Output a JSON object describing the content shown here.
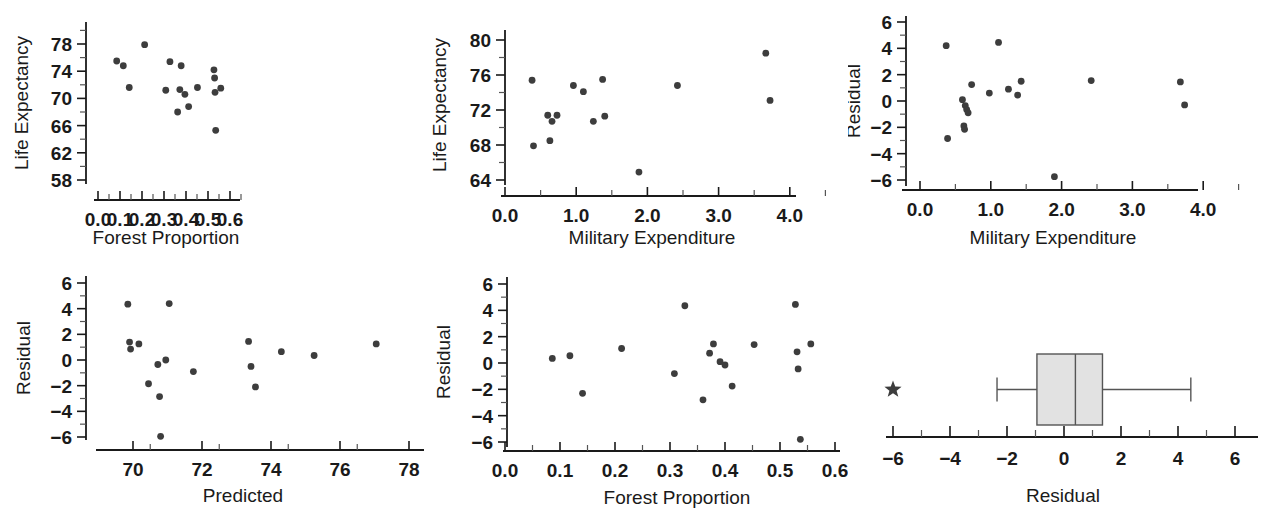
{
  "figure": {
    "layout": "2 rows x 3 columns of statistical panels",
    "background": "#ffffff",
    "point_color": "#3d3d3d",
    "axis_color": "#1a1a1a",
    "box_fill": "#e2e2e2"
  },
  "chart_data": [
    {
      "id": "panel-life-vs-forest",
      "type": "scatter",
      "title": "",
      "xlabel": "Forest Proportion",
      "ylabel": "Life Expectancy",
      "xlim": [
        0.0,
        0.62
      ],
      "ylim": [
        57.0,
        79.5
      ],
      "xticks": [
        "0.0",
        "0.1",
        "0.2",
        "0.3",
        "0.4",
        "0.5",
        "0.6"
      ],
      "xtick_values": [
        0.0,
        0.1,
        0.2,
        0.3,
        0.4,
        0.5,
        0.6
      ],
      "yticks": [
        "78",
        "74",
        "70",
        "66",
        "62",
        "58"
      ],
      "ytick_values": [
        78,
        74,
        70,
        66,
        62,
        58
      ],
      "grid": false,
      "legend": "none",
      "points": [
        {
          "x": 0.085,
          "y": 75.5
        },
        {
          "x": 0.115,
          "y": 74.8
        },
        {
          "x": 0.142,
          "y": 71.6
        },
        {
          "x": 0.212,
          "y": 77.9
        },
        {
          "x": 0.308,
          "y": 71.2
        },
        {
          "x": 0.327,
          "y": 75.4
        },
        {
          "x": 0.362,
          "y": 68.0
        },
        {
          "x": 0.372,
          "y": 71.3
        },
        {
          "x": 0.378,
          "y": 74.8
        },
        {
          "x": 0.395,
          "y": 70.6
        },
        {
          "x": 0.412,
          "y": 68.8
        },
        {
          "x": 0.452,
          "y": 71.6
        },
        {
          "x": 0.527,
          "y": 74.2
        },
        {
          "x": 0.53,
          "y": 73.0
        },
        {
          "x": 0.532,
          "y": 70.9
        },
        {
          "x": 0.535,
          "y": 65.3
        },
        {
          "x": 0.558,
          "y": 71.5
        }
      ]
    },
    {
      "id": "panel-life-vs-military",
      "type": "scatter",
      "title": "",
      "xlabel": "Military Expenditure",
      "ylabel": "Life Expectancy",
      "xlim": [
        0.0,
        4.3
      ],
      "ylim": [
        62.8,
        80.8
      ],
      "xticks": [
        "0.0",
        "1.0",
        "2.0",
        "3.0",
        "4.0"
      ],
      "xtick_values": [
        0.0,
        1.0,
        2.0,
        3.0,
        4.0
      ],
      "yticks": [
        "80",
        "76",
        "72",
        "68",
        "64"
      ],
      "ytick_values": [
        80,
        76,
        72,
        68,
        64
      ],
      "grid": false,
      "legend": "none",
      "points": [
        {
          "x": 0.38,
          "y": 75.4
        },
        {
          "x": 0.4,
          "y": 67.9
        },
        {
          "x": 0.6,
          "y": 71.4
        },
        {
          "x": 0.63,
          "y": 68.5
        },
        {
          "x": 0.66,
          "y": 70.7
        },
        {
          "x": 0.73,
          "y": 71.4
        },
        {
          "x": 0.96,
          "y": 74.8
        },
        {
          "x": 1.1,
          "y": 74.1
        },
        {
          "x": 1.24,
          "y": 70.7
        },
        {
          "x": 1.37,
          "y": 75.5
        },
        {
          "x": 1.4,
          "y": 71.3
        },
        {
          "x": 1.88,
          "y": 64.9
        },
        {
          "x": 2.42,
          "y": 74.8
        },
        {
          "x": 3.66,
          "y": 78.5
        },
        {
          "x": 3.72,
          "y": 73.1
        }
      ]
    },
    {
      "id": "panel-residual-vs-military",
      "type": "scatter",
      "title": "",
      "xlabel": "Military Expenditure",
      "ylabel": "Residual",
      "xlim": [
        0.0,
        4.3
      ],
      "ylim": [
        -7.2,
        7.0
      ],
      "xticks": [
        "0.0",
        "1.0",
        "2.0",
        "3.0",
        "4.0"
      ],
      "xtick_values": [
        0.0,
        1.0,
        2.0,
        3.0,
        4.0
      ],
      "yticks": [
        "6",
        "4",
        "2",
        "0",
        "-2",
        "-4",
        "-6"
      ],
      "ytick_values": [
        6,
        4,
        2,
        0,
        -2,
        -4,
        -6
      ],
      "grid": false,
      "legend": "none",
      "points": [
        {
          "x": 0.37,
          "y": 4.2
        },
        {
          "x": 0.39,
          "y": -2.85
        },
        {
          "x": 0.6,
          "y": 0.1
        },
        {
          "x": 0.62,
          "y": -1.9
        },
        {
          "x": 0.63,
          "y": -2.15
        },
        {
          "x": 0.64,
          "y": -0.35
        },
        {
          "x": 0.66,
          "y": -0.65
        },
        {
          "x": 0.68,
          "y": -0.9
        },
        {
          "x": 0.73,
          "y": 1.25
        },
        {
          "x": 0.98,
          "y": 0.6
        },
        {
          "x": 1.11,
          "y": 4.45
        },
        {
          "x": 1.25,
          "y": 0.9
        },
        {
          "x": 1.38,
          "y": 0.45
        },
        {
          "x": 1.43,
          "y": 1.5
        },
        {
          "x": 1.9,
          "y": -5.75
        },
        {
          "x": 2.42,
          "y": 1.55
        },
        {
          "x": 3.68,
          "y": 1.45
        },
        {
          "x": 3.74,
          "y": -0.3
        }
      ]
    },
    {
      "id": "panel-residual-vs-predicted",
      "type": "scatter",
      "title": "",
      "xlabel": "Predicted",
      "ylabel": "Residual",
      "xlim": [
        68.9,
        78.6
      ],
      "ylim": [
        -7.2,
        7.0
      ],
      "xticks": [
        "70",
        "72",
        "74",
        "76",
        "78"
      ],
      "xtick_values": [
        70,
        72,
        74,
        76,
        78
      ],
      "yticks": [
        "6",
        "4",
        "2",
        "0",
        "-2",
        "-4",
        "-6"
      ],
      "ytick_values": [
        6,
        4,
        2,
        0,
        -2,
        -4,
        -6
      ],
      "grid": false,
      "legend": "none",
      "points": [
        {
          "x": 69.85,
          "y": 4.35
        },
        {
          "x": 69.9,
          "y": 1.4
        },
        {
          "x": 69.93,
          "y": 0.85
        },
        {
          "x": 70.17,
          "y": 1.25
        },
        {
          "x": 70.45,
          "y": -1.85
        },
        {
          "x": 70.72,
          "y": -0.35
        },
        {
          "x": 70.77,
          "y": -2.85
        },
        {
          "x": 70.8,
          "y": -5.95
        },
        {
          "x": 70.95,
          "y": 0.0
        },
        {
          "x": 71.05,
          "y": 4.4
        },
        {
          "x": 71.75,
          "y": -0.9
        },
        {
          "x": 73.35,
          "y": 1.45
        },
        {
          "x": 73.42,
          "y": -0.5
        },
        {
          "x": 73.55,
          "y": -2.1
        },
        {
          "x": 74.3,
          "y": 0.65
        },
        {
          "x": 75.25,
          "y": 0.35
        },
        {
          "x": 77.05,
          "y": 1.25
        }
      ]
    },
    {
      "id": "panel-residual-vs-forest",
      "type": "scatter",
      "title": "",
      "xlabel": "Forest Proportion",
      "ylabel": "Residual",
      "xlim": [
        0.0,
        0.62
      ],
      "ylim": [
        -7.2,
        7.0
      ],
      "xticks": [
        "0.0",
        "0.1",
        "0.2",
        "0.3",
        "0.4",
        "0.5",
        "0.6"
      ],
      "xtick_values": [
        0.0,
        0.1,
        0.2,
        0.3,
        0.4,
        0.5,
        0.6
      ],
      "yticks": [
        "6",
        "4",
        "2",
        "0",
        "-2",
        "-4",
        "-6"
      ],
      "ytick_values": [
        6,
        4,
        2,
        0,
        -2,
        -4,
        -6
      ],
      "grid": false,
      "legend": "none",
      "points": [
        {
          "x": 0.086,
          "y": 0.35
        },
        {
          "x": 0.118,
          "y": 0.55
        },
        {
          "x": 0.141,
          "y": -2.3
        },
        {
          "x": 0.212,
          "y": 1.1
        },
        {
          "x": 0.308,
          "y": -0.8
        },
        {
          "x": 0.327,
          "y": 4.35
        },
        {
          "x": 0.36,
          "y": -2.8
        },
        {
          "x": 0.372,
          "y": 0.75
        },
        {
          "x": 0.379,
          "y": 1.45
        },
        {
          "x": 0.391,
          "y": 0.1
        },
        {
          "x": 0.4,
          "y": -0.15
        },
        {
          "x": 0.413,
          "y": -1.75
        },
        {
          "x": 0.453,
          "y": 1.4
        },
        {
          "x": 0.528,
          "y": 4.45
        },
        {
          "x": 0.531,
          "y": 0.85
        },
        {
          "x": 0.533,
          "y": -0.45
        },
        {
          "x": 0.537,
          "y": -5.8
        },
        {
          "x": 0.556,
          "y": 1.45
        }
      ]
    },
    {
      "id": "panel-residual-boxplot",
      "type": "boxplot",
      "title": "",
      "xlabel": "Residual",
      "ylabel": "",
      "xlim": [
        -7.2,
        7.2
      ],
      "xticks": [
        "-6",
        "-4",
        "-2",
        "0",
        "2",
        "4",
        "6"
      ],
      "xtick_values": [
        -6,
        -4,
        -2,
        0,
        2,
        4,
        6
      ],
      "grid": false,
      "legend": "none",
      "box": {
        "whisker_low": -2.35,
        "q1": -0.95,
        "median": 0.4,
        "q3": 1.35,
        "whisker_high": 4.45
      },
      "outliers": [
        -6.0
      ],
      "outlier_marker": "star"
    }
  ]
}
